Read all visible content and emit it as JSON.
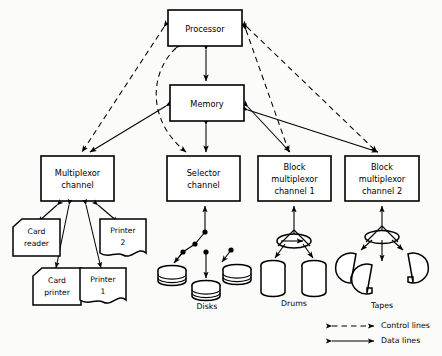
{
  "diagram": {
    "nodes": {
      "processor": {
        "label": "Processor",
        "x": 168,
        "y": 10,
        "w": 74,
        "h": 36
      },
      "memory": {
        "label": "Memory",
        "x": 170,
        "y": 85,
        "w": 74,
        "h": 36
      },
      "multiplexor_channel": {
        "line1": "Multiplexor",
        "line2": "channel",
        "x": 41,
        "y": 156,
        "w": 73,
        "h": 45
      },
      "selector_channel": {
        "line1": "Selector",
        "line2": "channel",
        "x": 167,
        "y": 156,
        "w": 73,
        "h": 45
      },
      "block_multiplexor_1": {
        "line1": "Block",
        "line2": "multiplexor",
        "line3": "channel 1",
        "x": 258,
        "y": 156,
        "w": 73,
        "h": 45
      },
      "block_multiplexor_2": {
        "line1": "Block",
        "line2": "multiplexor",
        "line3": "channel 2",
        "x": 345,
        "y": 156,
        "w": 74,
        "h": 45
      }
    },
    "devices": [
      {
        "name": "card-reader",
        "line1": "Card",
        "line2": "reader",
        "type": "card",
        "cx": 36,
        "cy": 240
      },
      {
        "name": "card-printer",
        "line1": "Card",
        "line2": "printer",
        "type": "card",
        "cx": 57,
        "cy": 287
      },
      {
        "name": "printer-1",
        "line1": "Printer",
        "line2": "1",
        "type": "paper",
        "cx": 103,
        "cy": 287
      },
      {
        "name": "printer-2",
        "line1": "Printer",
        "line2": "2",
        "type": "paper",
        "cx": 123,
        "cy": 240
      }
    ],
    "groups": {
      "disks": {
        "label": "Disks",
        "count": 3
      },
      "drums": {
        "label": "Drums",
        "count": 2
      },
      "tapes": {
        "label": "Tapes",
        "count": 3
      }
    },
    "legend": {
      "control": "Control lines",
      "data": "Data lines"
    },
    "colors": {
      "stroke": "#000000",
      "fill": "#ffffff",
      "background": "#fbfbf9"
    }
  }
}
